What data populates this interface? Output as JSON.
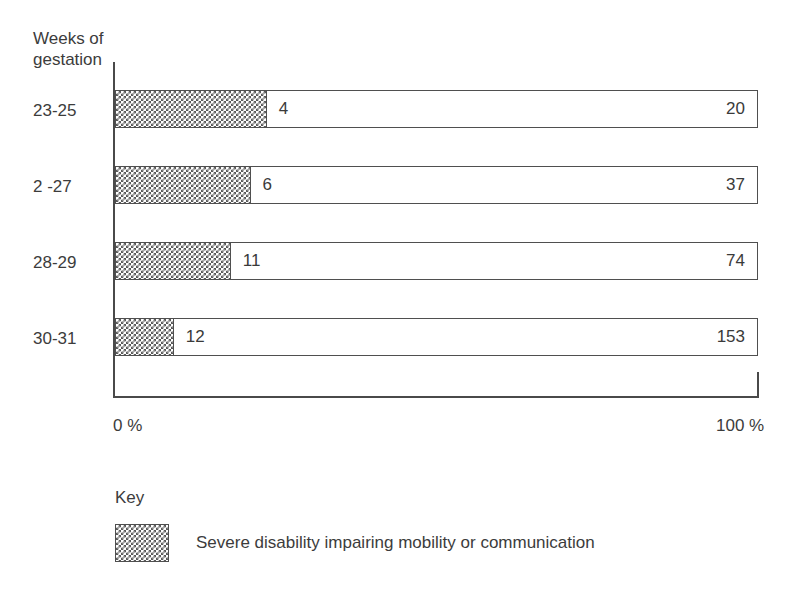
{
  "chart_data": {
    "type": "bar",
    "orientation": "horizontal",
    "stacked": true,
    "normalized_percent": true,
    "title": "",
    "ylabel": "Weeks of gestation",
    "xlabel": "",
    "categories": [
      "23-25",
      "2 -27",
      "28-29",
      "30-31"
    ],
    "axis_title_lines": [
      "Weeks of",
      "gestation"
    ],
    "xlim": [
      0,
      100
    ],
    "xtick_labels": [
      "0 %",
      "100 %"
    ],
    "grid": false,
    "legend": {
      "title": "Key",
      "position": "below",
      "entries": [
        {
          "label": "Severe disability impairing mobility or communication",
          "fill": "checker-hatch"
        }
      ]
    },
    "series": [
      {
        "name": "Severe disability impairing mobility or communication",
        "fill": "checker-hatch",
        "values": [
          4,
          6,
          11,
          12
        ],
        "percents": [
          23.5,
          21.0,
          17.9,
          9.0
        ]
      },
      {
        "name": "Remainder",
        "fill": "white",
        "values": [
          20,
          37,
          74,
          153
        ],
        "percents": [
          76.5,
          79.0,
          82.1,
          91.0
        ]
      }
    ],
    "rows": [
      {
        "category": "23-25",
        "hatched_value": 4,
        "open_value": 20,
        "hatched_percent": 23.5
      },
      {
        "category": "2 -27",
        "hatched_value": 6,
        "open_value": 37,
        "hatched_percent": 21.0
      },
      {
        "category": "28-29",
        "hatched_value": 11,
        "open_value": 74,
        "hatched_percent": 17.9
      },
      {
        "category": "30-31",
        "hatched_value": 12,
        "open_value": 153,
        "hatched_percent": 9.0
      }
    ],
    "colors": {
      "hatch_ink": "#5a5a5a",
      "outline": "#4f4f4f",
      "axis": "#4a4a4a",
      "text": "#3c3c3c",
      "background": "#ffffff"
    }
  }
}
